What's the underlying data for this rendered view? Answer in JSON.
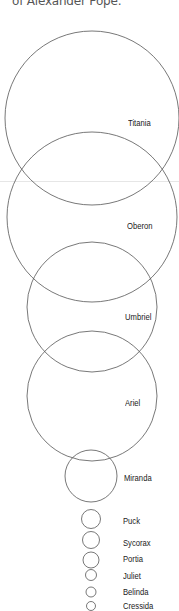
{
  "caption": "of Alexander Pope.",
  "colors": {
    "circle_stroke": "#555555",
    "label": "#1a1a1a",
    "caption": "#555555",
    "rule": "#e6e6e6"
  },
  "moons": [
    {
      "name": "Titania",
      "cx": 92,
      "cy": 118,
      "r": 87,
      "label_x": 128,
      "label_y": 118
    },
    {
      "name": "Oberon",
      "cx": 92,
      "cy": 217,
      "r": 85,
      "label_x": 127,
      "label_y": 221
    },
    {
      "name": "Umbriel",
      "cx": 92,
      "cy": 307,
      "r": 65,
      "label_x": 125,
      "label_y": 312
    },
    {
      "name": "Ariel",
      "cx": 92,
      "cy": 396,
      "r": 65,
      "label_x": 125,
      "label_y": 398
    },
    {
      "name": "Miranda",
      "cx": 91,
      "cy": 476,
      "r": 26,
      "label_x": 124,
      "label_y": 473
    },
    {
      "name": "Puck",
      "cx": 91,
      "cy": 519,
      "r": 9.5,
      "label_x": 123,
      "label_y": 516
    },
    {
      "name": "Sycorax",
      "cx": 91,
      "cy": 540,
      "r": 8.5,
      "label_x": 123,
      "label_y": 538
    },
    {
      "name": "Portia",
      "cx": 91,
      "cy": 560,
      "r": 8,
      "label_x": 123,
      "label_y": 554
    },
    {
      "name": "Juliet",
      "cx": 91,
      "cy": 575,
      "r": 5.5,
      "label_x": 123,
      "label_y": 571
    },
    {
      "name": "Belinda",
      "cx": 91,
      "cy": 592,
      "r": 5,
      "label_x": 123,
      "label_y": 587
    },
    {
      "name": "Cressida",
      "cx": 91,
      "cy": 606,
      "r": 4.5,
      "label_x": 123,
      "label_y": 601
    }
  ]
}
